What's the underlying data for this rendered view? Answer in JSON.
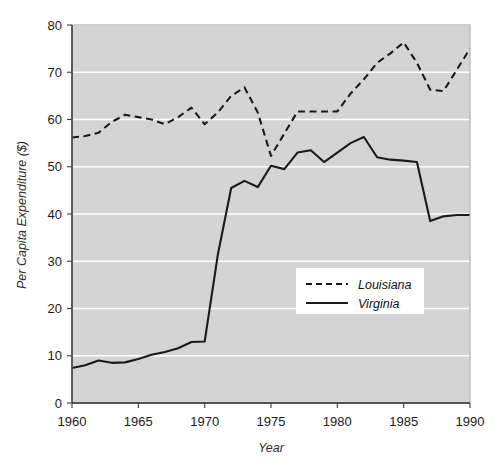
{
  "chart_data": {
    "type": "line",
    "title": "",
    "xlabel": "Year",
    "ylabel": "Per Capita Expenditure ($)",
    "xlim": [
      1960,
      1990
    ],
    "ylim": [
      0,
      80
    ],
    "xticks": [
      1960,
      1965,
      1970,
      1975,
      1980,
      1985,
      1990
    ],
    "yticks": [
      0,
      10,
      20,
      30,
      40,
      50,
      60,
      70,
      80
    ],
    "xtick_labels": [
      "1960",
      "1965",
      "1970",
      "1975",
      "1980",
      "1985",
      "1990"
    ],
    "ytick_labels": [
      "0",
      "10",
      "20",
      "30",
      "40",
      "50",
      "60",
      "70",
      "80"
    ],
    "grid": "horizontal",
    "plot_background": "#d4d4d4",
    "legend_position": "center-right-inside",
    "x": [
      1960,
      1961,
      1962,
      1963,
      1964,
      1965,
      1966,
      1967,
      1968,
      1969,
      1970,
      1971,
      1972,
      1973,
      1974,
      1975,
      1976,
      1977,
      1978,
      1979,
      1980,
      1981,
      1982,
      1983,
      1984,
      1985,
      1986,
      1987,
      1988,
      1989,
      1990
    ],
    "series": [
      {
        "name": "Louisiana",
        "style": "dashed",
        "color": "#1a1a1a",
        "values": [
          56.2,
          56.5,
          57.2,
          59.5,
          61.0,
          60.5,
          60.0,
          59.0,
          60.5,
          62.5,
          59.0,
          61.5,
          65.0,
          66.8,
          61.5,
          52.3,
          57.0,
          61.7,
          61.7,
          61.7,
          61.7,
          65.5,
          68.5,
          72.0,
          74.0,
          76.3,
          72.0,
          66.3,
          66.0,
          70.5,
          75.0
        ]
      },
      {
        "name": "Virginia",
        "style": "solid",
        "color": "#1a1a1a",
        "values": [
          7.4,
          8.0,
          9.0,
          8.5,
          8.6,
          9.3,
          10.2,
          10.8,
          11.6,
          12.9,
          13.0,
          31.5,
          45.5,
          47.0,
          45.7,
          50.2,
          49.5,
          53.0,
          53.5,
          51.0,
          53.0,
          55.0,
          56.3,
          52.0,
          51.5,
          51.3,
          51.0,
          38.5,
          39.5,
          39.8,
          39.8
        ]
      }
    ],
    "legend": [
      {
        "label": "Louisiana",
        "style": "dashed"
      },
      {
        "label": "Virginia",
        "style": "solid"
      }
    ]
  }
}
